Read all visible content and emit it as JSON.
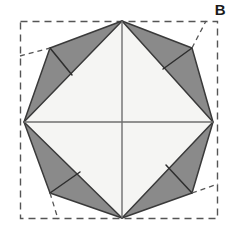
{
  "figure": {
    "label": "B",
    "caption_text": "B",
    "type": "geometric-folding-diagram",
    "canvas": {
      "width": 233,
      "height": 234
    },
    "colors": {
      "background": "#ffffff",
      "shaded_flap_fill": "#8a8a8a",
      "inner_square_fill": "#f5f5f3",
      "outline_stroke": "#3a3a3a",
      "crease_stroke": "#2e2e2e",
      "dashed_stroke": "#555555",
      "center_cross_stroke": "#6e6e6e",
      "label_color": "#1a1a1a"
    },
    "geometry": {
      "dashed_square": {
        "x": 20,
        "y": 21,
        "width": 198,
        "height": 198
      },
      "square_corners": [
        {
          "name": "top-left",
          "x": 20,
          "y": 21
        },
        {
          "name": "top-right",
          "x": 218,
          "y": 21
        },
        {
          "name": "bottom-right",
          "x": 218,
          "y": 219
        },
        {
          "name": "bottom-left",
          "x": 20,
          "y": 219
        }
      ],
      "octagon_vertices": [
        {
          "name": "top",
          "x": 122,
          "y": 21
        },
        {
          "name": "upper-right",
          "x": 192,
          "y": 48
        },
        {
          "name": "right",
          "x": 213,
          "y": 122
        },
        {
          "name": "lower-right",
          "x": 192,
          "y": 193
        },
        {
          "name": "bottom",
          "x": 122,
          "y": 218
        },
        {
          "name": "lower-left",
          "x": 50,
          "y": 193
        },
        {
          "name": "left",
          "x": 24,
          "y": 122
        },
        {
          "name": "upper-left",
          "x": 50,
          "y": 48
        }
      ],
      "inner_square_vertices": [
        {
          "name": "top",
          "x": 122,
          "y": 21
        },
        {
          "name": "right",
          "x": 213,
          "y": 122
        },
        {
          "name": "bottom",
          "x": 122,
          "y": 218
        },
        {
          "name": "left",
          "x": 24,
          "y": 122
        }
      ],
      "center_point": {
        "x": 118,
        "y": 120
      },
      "flap_count": 8,
      "crease_lines_per_flap": 1
    },
    "elements": {
      "dashed_outline_name": "original-square-outline",
      "octagon_name": "octagon-outline",
      "inner_square_name": "inner-square",
      "center_cross_name": "center-crease-cross",
      "flaps_name": "folded-flap",
      "corner_tip_name": "folded-corner-tip"
    }
  }
}
